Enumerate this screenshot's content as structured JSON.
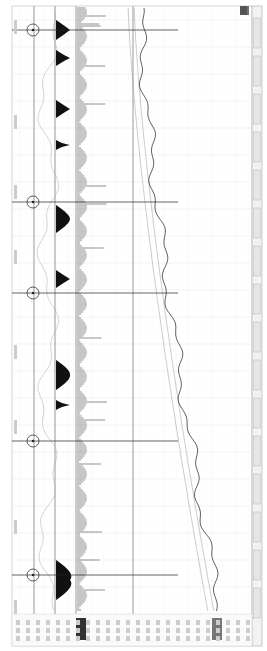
{
  "window": {
    "orientation": "rotated-90"
  },
  "toolbar": {
    "items": [
      "",
      "",
      "",
      "",
      "",
      "",
      "",
      "",
      "",
      "",
      "",
      "",
      "",
      "",
      "",
      ""
    ]
  },
  "time_axis": {
    "labels": [
      "",
      "",
      "",
      "",
      "",
      "",
      "",
      "",
      "",
      "",
      ""
    ]
  },
  "crosshairs": [
    {
      "y": 30
    },
    {
      "y": 202
    },
    {
      "y": 293
    },
    {
      "y": 441
    },
    {
      "y": 575
    }
  ],
  "colors": {
    "grid": "#e4e4e4",
    "axis": "#555555",
    "price": "#222222",
    "ma": "#999999",
    "volume": "#444444",
    "indicator": "#111111"
  },
  "chart_data": {
    "type": "line",
    "title": "",
    "xlabel": "",
    "ylabel": "",
    "panels": [
      "oscillator",
      "histogram",
      "volume",
      "price"
    ],
    "series": [
      {
        "name": "price",
        "values": [
          210,
          206,
          204,
          200,
          198,
          196,
          193,
          190,
          186,
          182,
          178,
          172,
          166,
          160,
          155,
          150,
          146,
          142,
          140,
          138,
          136,
          134
        ]
      },
      {
        "name": "ma1",
        "values": [
          208,
          205,
          202,
          199,
          196,
          193,
          190,
          187,
          183,
          179,
          174,
          169,
          164,
          159,
          154,
          150,
          146,
          143,
          140,
          138,
          136,
          134
        ]
      }
    ]
  }
}
